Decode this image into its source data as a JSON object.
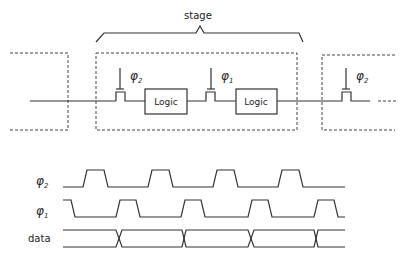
{
  "figure": {
    "stage_label": "stage",
    "logic_blocks": [
      {
        "label": "Logic"
      },
      {
        "label": "Logic"
      }
    ],
    "latches": [
      {
        "clock": "φ",
        "sub": "2"
      },
      {
        "clock": "φ",
        "sub": "1"
      },
      {
        "clock": "φ",
        "sub": "2"
      }
    ]
  },
  "timing": {
    "signals": [
      {
        "name": "φ",
        "sub": "2"
      },
      {
        "name": "φ",
        "sub": "1"
      },
      {
        "name": "data",
        "sub": ""
      }
    ]
  }
}
